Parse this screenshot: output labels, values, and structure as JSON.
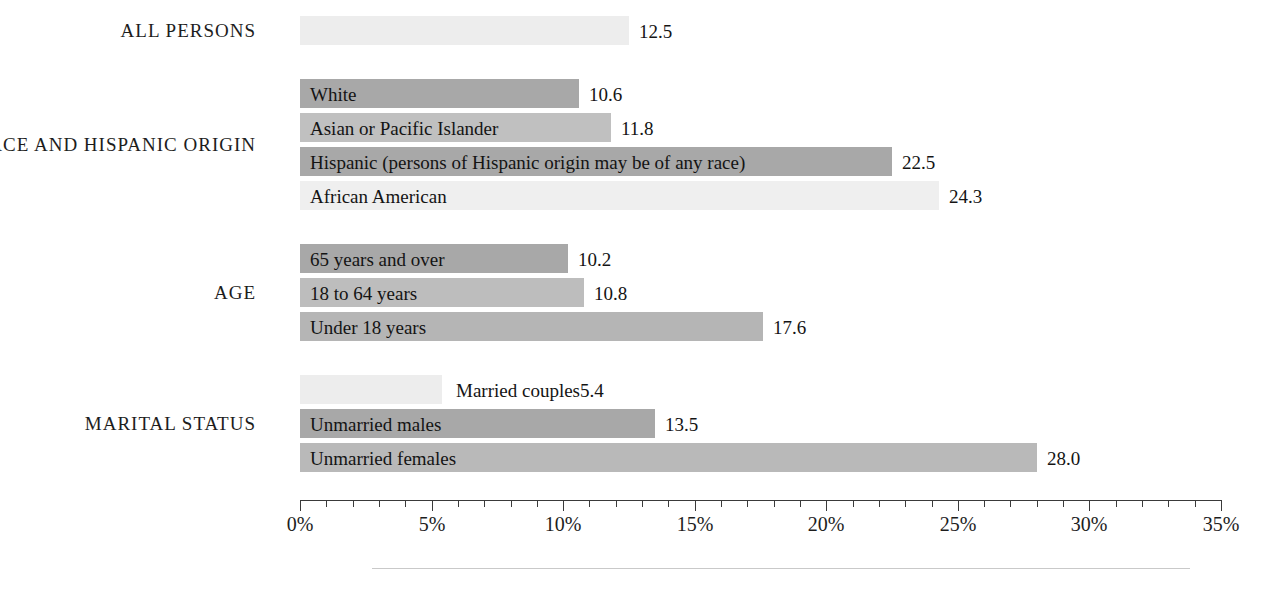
{
  "chart_data": {
    "type": "bar",
    "orientation": "horizontal",
    "title": "",
    "subtitle": "",
    "xlabel": "",
    "ylabel": "",
    "xlim": [
      0,
      35
    ],
    "xtick_labels": [
      "0%",
      "5%",
      "10%",
      "15%",
      "20%",
      "25%",
      "30%",
      "35%"
    ],
    "xtick_values": [
      0,
      5,
      10,
      15,
      20,
      25,
      30,
      35
    ],
    "minor_tick_step": 1,
    "grid": false,
    "legend": "none",
    "value_unit": "percent",
    "groups": [
      {
        "group_label": "ALL PERSONS",
        "bars": [
          {
            "label": "",
            "value": 12.5,
            "value_text": "12.5",
            "color": "#ededed",
            "label_inside": false
          }
        ]
      },
      {
        "group_label": "RACE AND HISPANIC ORIGIN",
        "bars": [
          {
            "label": "White",
            "value": 10.6,
            "value_text": "10.6",
            "color": "#a8a8a8",
            "label_inside": true
          },
          {
            "label": "Asian or Pacific Islander",
            "value": 11.8,
            "value_text": "11.8",
            "color": "#c0c0c0",
            "label_inside": true
          },
          {
            "label": "Hispanic (persons of Hispanic origin may be of any race)",
            "value": 22.5,
            "value_text": "22.5",
            "color": "#a8a8a8",
            "label_inside": true
          },
          {
            "label": "African American",
            "value": 24.3,
            "value_text": "24.3",
            "color": "#efefef",
            "label_inside": true
          }
        ]
      },
      {
        "group_label": "AGE",
        "bars": [
          {
            "label": "65 years and over",
            "value": 10.2,
            "value_text": "10.2",
            "color": "#a8a8a8",
            "label_inside": true
          },
          {
            "label": "18 to 64 years",
            "value": 10.8,
            "value_text": "10.8",
            "color": "#bdbdbd",
            "label_inside": true
          },
          {
            "label": "Under 18 years",
            "value": 17.6,
            "value_text": "17.6",
            "color": "#b5b5b5",
            "label_inside": true
          }
        ]
      },
      {
        "group_label": "MARITAL STATUS",
        "bars": [
          {
            "label": "Married couples",
            "value": 5.4,
            "value_text": "5.4",
            "color": "#ededed",
            "label_inside": false
          },
          {
            "label": "Unmarried males",
            "value": 13.5,
            "value_text": "13.5",
            "color": "#a8a8a8",
            "label_inside": true
          },
          {
            "label": "Unmarried females",
            "value": 28.0,
            "value_text": "28.0",
            "color": "#b9b9b9",
            "label_inside": true
          }
        ]
      }
    ]
  },
  "colors": {
    "axis": "#3a3a3a",
    "text": "#1a1a1a",
    "bottom_rule": "#c9c9c9",
    "bar_dark": "#a8a8a8",
    "bar_mid": "#bdbdbd",
    "bar_light": "#ededed"
  }
}
